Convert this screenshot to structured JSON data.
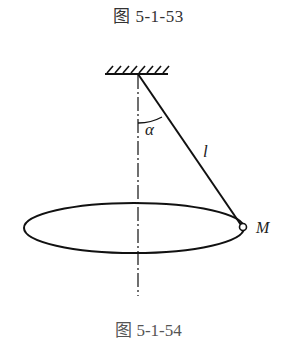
{
  "figure": {
    "caption_top": "图 5-1-53",
    "caption_bottom": "图 5-1-54",
    "labels": {
      "angle": "α",
      "length": "l",
      "point": "M"
    },
    "elements": {
      "ceiling": "fixed support with hatching",
      "string": "pendulum string from pivot to M",
      "axis": "vertical dash-dot axis through pivot",
      "orbit": "horizontal circular path shown as ellipse",
      "bob": "small circle at M"
    }
  }
}
